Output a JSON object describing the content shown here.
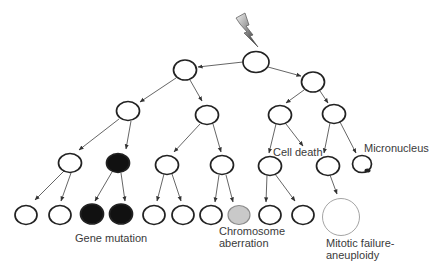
{
  "diagram": {
    "colors": {
      "outline": "#222222",
      "mutation_fill": "#111111",
      "aberration_fill": "#c9c9c9",
      "aberration_stroke": "#8a8a8a",
      "aneuploidy_stroke": "#9a9a9a",
      "edge": "#4a4a4a",
      "text": "#3a3a3a"
    },
    "labels": {
      "cell_death": "Cell death",
      "micronucleus": "Micronucleus",
      "gene_mutation": "Gene mutation",
      "chromosome_aberration_line1": "Chromosome",
      "chromosome_aberration_line2": "aberration",
      "mitotic_failure_line1": "Mitotic failure-",
      "mitotic_failure_line2": "aneuploidy"
    },
    "damage_icon": "lightning-bolt",
    "nodes": [
      {
        "id": "root",
        "cx": 256,
        "cy": 62,
        "rx": 13,
        "ry": 10.5,
        "type": "normal"
      },
      {
        "id": "g1-left",
        "cx": 185,
        "cy": 70,
        "rx": 11.5,
        "ry": 10,
        "type": "normal"
      },
      {
        "id": "g1-right",
        "cx": 313,
        "cy": 82,
        "rx": 11.5,
        "ry": 10,
        "type": "normal"
      },
      {
        "id": "g2-a",
        "cx": 128,
        "cy": 111,
        "rx": 11.5,
        "ry": 9.5,
        "type": "normal"
      },
      {
        "id": "g2-b",
        "cx": 207,
        "cy": 115,
        "rx": 11.5,
        "ry": 9.5,
        "type": "normal"
      },
      {
        "id": "g2-c",
        "cx": 280,
        "cy": 115,
        "rx": 11.5,
        "ry": 9.5,
        "type": "normal"
      },
      {
        "id": "g2-d",
        "cx": 334,
        "cy": 114,
        "rx": 11.5,
        "ry": 9.5,
        "type": "normal"
      },
      {
        "id": "g3-a",
        "cx": 70,
        "cy": 163,
        "rx": 11.5,
        "ry": 9.5,
        "type": "normal"
      },
      {
        "id": "g3-b",
        "cx": 118,
        "cy": 163,
        "rx": 11.5,
        "ry": 9.5,
        "type": "mutation"
      },
      {
        "id": "g3-c",
        "cx": 167,
        "cy": 165,
        "rx": 11.5,
        "ry": 9.5,
        "type": "normal"
      },
      {
        "id": "g3-d",
        "cx": 222,
        "cy": 165,
        "rx": 11.5,
        "ry": 9.5,
        "type": "normal"
      },
      {
        "id": "g3-e",
        "cx": 270,
        "cy": 166,
        "rx": 11.5,
        "ry": 9.5,
        "type": "normal"
      },
      {
        "id": "g3-f",
        "cx": 328,
        "cy": 166,
        "rx": 11.5,
        "ry": 9.5,
        "type": "normal"
      },
      {
        "id": "g3-micronucleus",
        "cx": 362,
        "cy": 164,
        "rx": 9.5,
        "ry": 8.5,
        "type": "micronucleus"
      },
      {
        "id": "g4-1",
        "cx": 26,
        "cy": 215,
        "rx": 11,
        "ry": 9.5,
        "type": "normal"
      },
      {
        "id": "g4-2",
        "cx": 60,
        "cy": 215,
        "rx": 11,
        "ry": 9.5,
        "type": "normal"
      },
      {
        "id": "g4-3",
        "cx": 92,
        "cy": 214,
        "rx": 11.5,
        "ry": 10,
        "type": "mutation"
      },
      {
        "id": "g4-4",
        "cx": 121,
        "cy": 214,
        "rx": 11.5,
        "ry": 10,
        "type": "mutation"
      },
      {
        "id": "g4-5",
        "cx": 154,
        "cy": 215,
        "rx": 11,
        "ry": 9.5,
        "type": "normal"
      },
      {
        "id": "g4-6",
        "cx": 183,
        "cy": 215,
        "rx": 11,
        "ry": 9.5,
        "type": "normal"
      },
      {
        "id": "g4-7",
        "cx": 211,
        "cy": 215,
        "rx": 11,
        "ry": 9.5,
        "type": "normal"
      },
      {
        "id": "g4-8",
        "cx": 239,
        "cy": 215,
        "rx": 11,
        "ry": 9.5,
        "type": "aberration"
      },
      {
        "id": "g4-9",
        "cx": 270,
        "cy": 215,
        "rx": 11,
        "ry": 9.5,
        "type": "normal"
      },
      {
        "id": "g4-10",
        "cx": 303,
        "cy": 215,
        "rx": 11,
        "ry": 9.5,
        "type": "normal"
      },
      {
        "id": "g4-aneuploid",
        "cx": 341,
        "cy": 217,
        "rx": 18.5,
        "ry": 18.5,
        "type": "aneuploid"
      }
    ],
    "edges": [
      {
        "from": "root",
        "to": "g1-left",
        "x1": 243,
        "y1": 62,
        "x2": 198,
        "y2": 67
      },
      {
        "from": "root",
        "to": "g1-right",
        "x1": 268,
        "y1": 67,
        "x2": 301,
        "y2": 76
      },
      {
        "from": "g1-left",
        "to": "g2-a",
        "x1": 176,
        "y1": 78,
        "x2": 140,
        "y2": 102
      },
      {
        "from": "g1-left",
        "to": "g2-b",
        "x1": 190,
        "y1": 80,
        "x2": 202,
        "y2": 101
      },
      {
        "from": "g1-right",
        "to": "g2-c",
        "x1": 304,
        "y1": 90,
        "x2": 286,
        "y2": 103
      },
      {
        "from": "g1-right",
        "to": "g2-d",
        "x1": 320,
        "y1": 91,
        "x2": 328,
        "y2": 103
      },
      {
        "from": "g2-a",
        "to": "g3-a",
        "x1": 119,
        "y1": 119,
        "x2": 79,
        "y2": 150
      },
      {
        "from": "g2-a",
        "to": "g3-b",
        "x1": 131,
        "y1": 121,
        "x2": 126,
        "y2": 149
      },
      {
        "from": "g2-b",
        "to": "g3-c",
        "x1": 200,
        "y1": 124,
        "x2": 174,
        "y2": 152
      },
      {
        "from": "g2-b",
        "to": "g3-d",
        "x1": 213,
        "y1": 124,
        "x2": 221,
        "y2": 152
      },
      {
        "from": "g2-c",
        "to": "g3-e",
        "x1": 276,
        "y1": 124,
        "x2": 269,
        "y2": 153
      },
      {
        "from": "g2-c",
        "to": "cell-death",
        "x1": 286,
        "y1": 124,
        "x2": 303,
        "y2": 146
      },
      {
        "from": "g2-d",
        "to": "g3-f",
        "x1": 330,
        "y1": 123,
        "x2": 324,
        "y2": 153
      },
      {
        "from": "g2-d",
        "to": "g3-micronucleus",
        "x1": 340,
        "y1": 122,
        "x2": 356,
        "y2": 153
      },
      {
        "from": "g3-a",
        "to": "g4-1",
        "x1": 64,
        "y1": 171,
        "x2": 35,
        "y2": 200
      },
      {
        "from": "g3-a",
        "to": "g4-2",
        "x1": 71,
        "y1": 173,
        "x2": 61,
        "y2": 201
      },
      {
        "from": "g3-b",
        "to": "g4-3",
        "x1": 112,
        "y1": 172,
        "x2": 95,
        "y2": 201
      },
      {
        "from": "g3-b",
        "to": "g4-4",
        "x1": 121,
        "y1": 173,
        "x2": 125,
        "y2": 201
      },
      {
        "from": "g3-c",
        "to": "g4-5",
        "x1": 164,
        "y1": 174,
        "x2": 157,
        "y2": 201
      },
      {
        "from": "g3-c",
        "to": "g4-6",
        "x1": 172,
        "y1": 174,
        "x2": 181,
        "y2": 201
      },
      {
        "from": "g3-d",
        "to": "g4-7",
        "x1": 219,
        "y1": 175,
        "x2": 215,
        "y2": 202
      },
      {
        "from": "g3-d",
        "to": "g4-8",
        "x1": 226,
        "y1": 175,
        "x2": 233,
        "y2": 202
      },
      {
        "from": "g3-e",
        "to": "g4-9",
        "x1": 267,
        "y1": 175,
        "x2": 266,
        "y2": 202
      },
      {
        "from": "g3-e",
        "to": "g4-10",
        "x1": 275,
        "y1": 174,
        "x2": 295,
        "y2": 201
      },
      {
        "from": "g3-f",
        "to": "g4-aneuploid",
        "x1": 330,
        "y1": 175,
        "x2": 337,
        "y2": 194
      }
    ]
  }
}
